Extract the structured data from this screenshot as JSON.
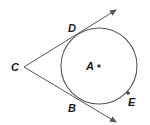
{
  "diagram": {
    "type": "geometry-circle-tangents",
    "colors": {
      "stroke": "#555555",
      "text": "#1a1a1a",
      "point": "#444444",
      "background": "#ffffff"
    },
    "circle": {
      "center_label": "A",
      "cx": 99,
      "cy": 66,
      "r": 38
    },
    "points": [
      {
        "label": "C",
        "x": 24,
        "y": 67,
        "label_x": 11,
        "label_y": 71
      },
      {
        "label": "D",
        "x": 80,
        "y": 30,
        "label_x": 68,
        "label_y": 32
      },
      {
        "label": "B",
        "x": 80,
        "y": 103,
        "label_x": 68,
        "label_y": 112
      },
      {
        "label": "A",
        "x": 99,
        "y": 66,
        "label_x": 85,
        "label_y": 70
      },
      {
        "label": "E",
        "x": 128,
        "y": 93,
        "label_x": 128,
        "label_y": 106
      }
    ],
    "rays": [
      {
        "name": "ray-CD",
        "from": "C",
        "through": "D",
        "end_x": 116,
        "end_y": 10
      },
      {
        "name": "ray-CB",
        "from": "C",
        "through": "B",
        "end_x": 116,
        "end_y": 122
      }
    ]
  }
}
